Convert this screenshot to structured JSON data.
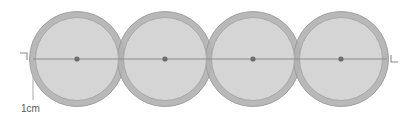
{
  "diagram": {
    "canvas": {
      "width": 415,
      "height": 117,
      "background": "#ffffff"
    },
    "colors": {
      "ring_fill": "#b2b2b2",
      "ring_stroke": "#9a9a9a",
      "inner_fill": "#d5d5d5",
      "inner_stroke": "#a8a8a8",
      "axis_line": "#8c8c8c",
      "center_dot": "#6e6e6e",
      "leader_line": "#b8b8b8",
      "marker": "#8a8a8a",
      "label_text": "#5a5a5a"
    },
    "axis": {
      "name": "centre-axis",
      "y": 59,
      "x_start": 33,
      "x_end": 387,
      "stroke_width": 1
    },
    "markers": {
      "left": {
        "name": "left-corner-bracket",
        "glyph": "top-left-corner",
        "x": 20,
        "y": 52,
        "size": 7
      },
      "right": {
        "name": "right-corner-bracket",
        "glyph": "bottom-left-corner",
        "x": 391,
        "y": 54,
        "size": 7
      }
    },
    "rings": [
      {
        "name": "ring-1",
        "cx": 77,
        "cy": 59,
        "outer_r": 48,
        "inner_r": 42,
        "dot_r": 2.6
      },
      {
        "name": "ring-2",
        "cx": 165,
        "cy": 59,
        "outer_r": 48,
        "inner_r": 42,
        "dot_r": 2.6
      },
      {
        "name": "ring-3",
        "cx": 253,
        "cy": 59,
        "outer_r": 48,
        "inner_r": 42,
        "dot_r": 2.6
      },
      {
        "name": "ring-4",
        "cx": 341,
        "cy": 59,
        "outer_r": 48,
        "inner_r": 42,
        "dot_r": 2.6
      }
    ],
    "dimension": {
      "label": "1cm",
      "label_x": 21,
      "label_baseline": 112,
      "leader": {
        "x": 33,
        "y_top": 60,
        "y_bottom": 100
      }
    }
  }
}
